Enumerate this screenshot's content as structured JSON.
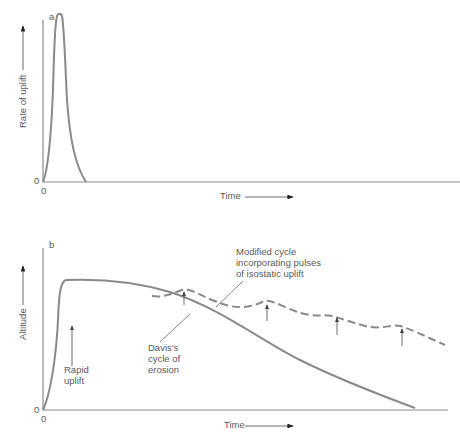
{
  "panel_a": {
    "letter": "a",
    "y_axis_label": "Rate of uplift",
    "x_axis_label": "Time",
    "origin_y": "0",
    "origin_x": "0"
  },
  "panel_b": {
    "letter": "b",
    "y_axis_label": "Altitude",
    "x_axis_label": "Time",
    "origin_y": "0",
    "origin_x": "0",
    "annotations": {
      "rapid_uplift": [
        "Rapid",
        "uplift"
      ],
      "davis": [
        "Davis's",
        "cycle of",
        "erosion"
      ],
      "modified": [
        "Modified cycle",
        "incorporating pulses",
        "of isostatic uplift"
      ]
    }
  },
  "colors": {
    "curve": "#8a8a8a",
    "axis": "#8a8a8a",
    "text": "#5a5a5a"
  }
}
